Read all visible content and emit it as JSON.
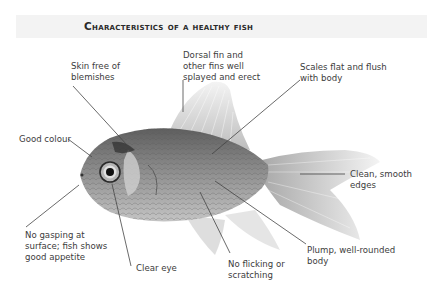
{
  "title": "Characteristics of a healthy fish",
  "colors": {
    "title_band": "#f3f3f3",
    "text": "#3c3c3c",
    "leader_line": "#444444",
    "fish_body": "#8a8a8a",
    "fins": "#d8d8d8"
  },
  "labels": {
    "skin": {
      "line1": "Skin free of",
      "line2": "blemishes"
    },
    "dorsal": {
      "line1": "Dorsal fin and",
      "line2": "other fins well",
      "line3": "splayed and erect"
    },
    "scales": {
      "line1": "Scales flat and flush",
      "line2": "with body"
    },
    "colour": {
      "line1": "Good colour"
    },
    "edges": {
      "line1": "Clean, smooth",
      "line2": "edges"
    },
    "gasping": {
      "line1": "No gasping at",
      "line2": "surface; fish shows",
      "line3": "good appetite"
    },
    "eye": {
      "line1": "Clear eye"
    },
    "flicking": {
      "line1": "No flicking or",
      "line2": "scratching"
    },
    "plump": {
      "line1": "Plump, well-rounded",
      "line2": "body"
    }
  }
}
